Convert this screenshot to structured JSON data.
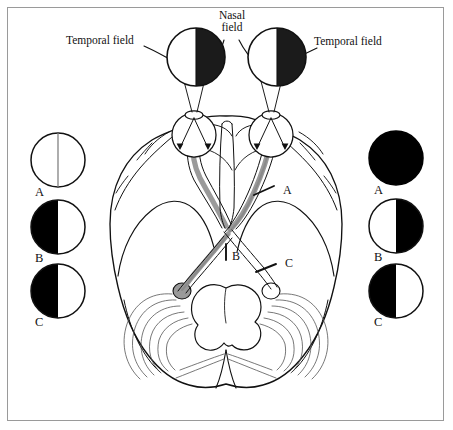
{
  "figure": {
    "title_visible": false,
    "border_color": "#9a9a9a",
    "background": "#ffffff",
    "ink_color": "#111111",
    "tract_color": "#9a9a9a",
    "tract_dark_color": "#8a8a8a"
  },
  "callouts": {
    "temporal_field_left": "Temporal field",
    "temporal_field_right": "Temporal field",
    "nasal_field": "Nasal\nfield"
  },
  "eye_fields": [
    {
      "name": "left-eye-visual-field",
      "left_half": "white",
      "right_half": "black",
      "cx": 196,
      "cy": 57,
      "r": 29
    },
    {
      "name": "right-eye-visual-field",
      "left_half": "white",
      "right_half": "black",
      "cx": 277,
      "cy": 57,
      "r": 29
    }
  ],
  "lesion_markers": [
    {
      "label": "A",
      "x": 283,
      "y": 191,
      "site": "optic-nerve"
    },
    {
      "label": "B",
      "x": 236,
      "y": 257,
      "site": "optic-chiasm"
    },
    {
      "label": "C",
      "x": 285,
      "y": 264,
      "site": "optic-tract"
    }
  ],
  "left_legend": {
    "name": "left-eye-defect-column",
    "items": [
      {
        "label": "A",
        "left_half": "white",
        "right_half": "white",
        "divider": true,
        "cx": 58,
        "cy": 160,
        "r": 27
      },
      {
        "label": "B",
        "left_half": "black",
        "right_half": "white",
        "divider": false,
        "cx": 58,
        "cy": 227,
        "r": 27
      },
      {
        "label": "C",
        "left_half": "black",
        "right_half": "white",
        "divider": false,
        "cx": 58,
        "cy": 291,
        "r": 27
      }
    ]
  },
  "right_legend": {
    "name": "right-eye-defect-column",
    "items": [
      {
        "label": "A",
        "left_half": "black",
        "right_half": "black",
        "divider": false,
        "cx": 396,
        "cy": 158,
        "r": 27
      },
      {
        "label": "B",
        "left_half": "white",
        "right_half": "black",
        "divider": false,
        "cx": 396,
        "cy": 226,
        "r": 27
      },
      {
        "label": "C",
        "left_half": "black",
        "right_half": "white",
        "divider": false,
        "cx": 396,
        "cy": 291,
        "r": 27
      }
    ]
  }
}
